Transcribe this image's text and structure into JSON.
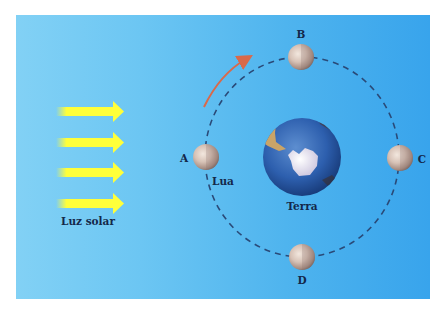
{
  "diagram": {
    "title": "",
    "sunlight": {
      "label": "Luz solar",
      "arrow_count": 4,
      "color": "#ffff3a"
    },
    "earth": {
      "label": "Terra"
    },
    "moon": {
      "label": "Lua"
    },
    "positions": [
      {
        "id": "A",
        "label": "A"
      },
      {
        "id": "B",
        "label": "B"
      },
      {
        "id": "C",
        "label": "C"
      },
      {
        "id": "D",
        "label": "D"
      }
    ],
    "orbit": {
      "style": "dashed",
      "color": "#2a4a78"
    },
    "direction_arrow": {
      "color": "#d9694a",
      "meaning": "orbit direction (counter-clockwise)"
    },
    "colors": {
      "background_left": "#82d1f5",
      "background_right": "#38a4ec",
      "text": "#14284a"
    }
  }
}
